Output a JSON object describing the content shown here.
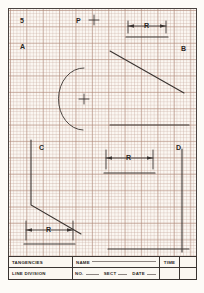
{
  "sheet": {
    "paper_color": "#fbf7f2",
    "grid_color": "#b08a7a",
    "ink_color": "#3a3431"
  },
  "drawing": {
    "labels": [
      {
        "name": "label-5",
        "text": "5",
        "x": 18,
        "y": 16
      },
      {
        "name": "label-P",
        "text": "P",
        "x": 76,
        "y": 16
      },
      {
        "name": "label-A",
        "text": "A",
        "x": 18,
        "y": 42
      },
      {
        "name": "label-B",
        "text": "B",
        "x": 180,
        "y": 44
      },
      {
        "name": "label-C",
        "text": "C",
        "x": 38,
        "y": 143
      },
      {
        "name": "label-D",
        "text": "D",
        "x": 176,
        "y": 143
      }
    ],
    "dimensions": [
      {
        "name": "dimension-r-top-right",
        "text": "R"
      },
      {
        "name": "dimension-r-middle-right",
        "text": "R"
      },
      {
        "name": "dimension-r-bottom-left",
        "text": "R"
      }
    ],
    "center_marks": [
      {
        "name": "center-mark-p",
        "x": 85,
        "y": 19
      },
      {
        "name": "center-mark-arc",
        "x": 85,
        "y": 90
      }
    ]
  },
  "titleblock": {
    "exercise_title_line1": "TANGENCIES",
    "exercise_title_line2": "LINE  DIVISION",
    "name_label": "NAME",
    "no_label": "NO.",
    "sect_label": "SECT",
    "date_label": "DATE",
    "time_label": "TIME"
  }
}
